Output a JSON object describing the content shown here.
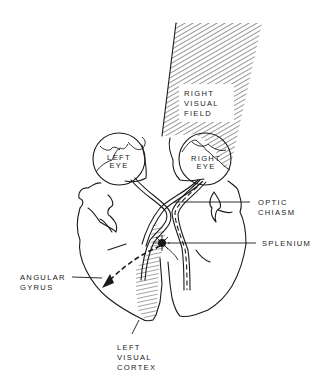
{
  "figure": {
    "type": "anatomical-diagram"
  },
  "labels": {
    "visual_field": [
      "RIGHT",
      "VISUAL",
      "FIELD"
    ],
    "left_eye": [
      "LEFT",
      "EYE"
    ],
    "right_eye": [
      "RIGHT",
      "EYE"
    ],
    "optic_chiasm": [
      "OPTIC",
      "CHIASM"
    ],
    "splenium": [
      "SPLENIUM"
    ],
    "angular_gyrus": [
      "ANGULAR",
      "GYRUS"
    ],
    "left_visual_cortex": [
      "LEFT",
      "VISUAL",
      "CORTEX"
    ]
  },
  "colors": {
    "ink": "#1a1a1a",
    "background": "#ffffff"
  }
}
